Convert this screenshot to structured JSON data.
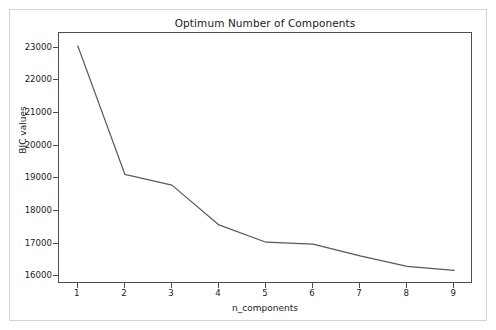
{
  "figure": {
    "background_color": "#ffffff",
    "frame_color": "#d2d2d2",
    "axis_color": "#4d4d4d",
    "line_color": "#5a5a5a"
  },
  "chart_data": {
    "type": "line",
    "title": "Optimum Number of Components",
    "xlabel": "n_components",
    "ylabel": "BIC values",
    "x": [
      1,
      2,
      3,
      4,
      5,
      6,
      7,
      8,
      9
    ],
    "values": [
      23050,
      19120,
      18790,
      17570,
      17040,
      16980,
      16620,
      16300,
      16180
    ],
    "series": [
      {
        "name": "BIC values",
        "values": [
          23050,
          19120,
          18790,
          17570,
          17040,
          16980,
          16620,
          16300,
          16180
        ]
      }
    ],
    "xtick_labels": [
      "1",
      "2",
      "3",
      "4",
      "5",
      "6",
      "7",
      "8",
      "9"
    ],
    "ytick_labels": [
      "16000",
      "17000",
      "18000",
      "19000",
      "20000",
      "21000",
      "22000",
      "23000"
    ],
    "ytick_values": [
      16000,
      17000,
      18000,
      19000,
      20000,
      21000,
      22000,
      23000
    ],
    "xlim": [
      0.6,
      9.4
    ],
    "ylim": [
      15760,
      23450
    ],
    "grid": false,
    "legend": false,
    "markers": false,
    "line_width": 1.2
  }
}
